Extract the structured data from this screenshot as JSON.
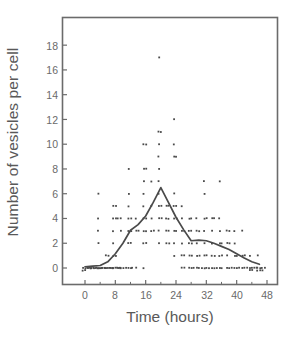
{
  "chart_data": {
    "type": "scatter",
    "title": "",
    "xlabel": "Time (hours)",
    "ylabel": "Number of vesicles per cell",
    "xlim": [
      -3,
      51
    ],
    "ylim": [
      -1.2,
      19.2
    ],
    "xticks": [
      0,
      8,
      16,
      24,
      32,
      40,
      48
    ],
    "yticks": [
      0,
      2,
      4,
      6,
      8,
      10,
      12,
      14,
      16,
      18
    ],
    "xtick_labels": [
      "0",
      "8",
      "16",
      "24",
      "32",
      "40",
      "48"
    ],
    "ytick_labels": [
      "0",
      "2",
      "4",
      "6",
      "8",
      "10",
      "12",
      "14",
      "16",
      "18"
    ],
    "grid": false,
    "legend": null,
    "frame": "full-box",
    "marker": "small-square-dot",
    "marker_color": "#4a4a4a",
    "line_color": "#4a4a4a",
    "axis_color": "#6b6b6b",
    "background": "#ffffff",
    "series": [
      {
        "name": "mean vesicles per cell",
        "type": "line",
        "x": [
          0,
          2,
          4,
          6,
          8,
          10,
          12,
          14,
          16,
          18,
          20,
          22,
          24,
          26,
          28,
          30,
          32,
          34,
          36,
          38,
          40,
          42,
          44,
          46
        ],
        "values": [
          0.1,
          0.15,
          0.2,
          0.5,
          1.15,
          2.0,
          3.05,
          3.5,
          4.2,
          5.3,
          6.5,
          5.3,
          4.1,
          3.1,
          2.2,
          2.25,
          2.2,
          2.0,
          1.75,
          1.5,
          1.15,
          0.8,
          0.5,
          0.3
        ]
      },
      {
        "name": "individual cell observations",
        "type": "scatter",
        "points": [
          [
            0,
            0
          ],
          [
            0,
            0
          ],
          [
            0,
            0
          ],
          [
            0,
            0
          ],
          [
            0,
            0
          ],
          [
            0,
            0
          ],
          [
            1,
            0
          ],
          [
            1,
            0
          ],
          [
            1,
            0
          ],
          [
            2,
            0
          ],
          [
            2,
            0
          ],
          [
            2,
            0
          ],
          [
            2,
            0
          ],
          [
            3,
            0
          ],
          [
            3,
            0
          ],
          [
            3,
            0
          ],
          [
            4,
            0
          ],
          [
            4,
            0
          ],
          [
            4,
            0
          ],
          [
            4,
            0
          ],
          [
            5,
            0
          ],
          [
            5,
            0
          ],
          [
            6,
            0
          ],
          [
            6,
            0
          ],
          [
            6,
            0
          ],
          [
            6,
            0
          ],
          [
            7,
            0
          ],
          [
            7,
            0
          ],
          [
            8,
            0
          ],
          [
            8,
            0
          ],
          [
            8,
            0
          ],
          [
            8,
            0
          ],
          [
            9,
            0
          ],
          [
            9,
            0
          ],
          [
            10,
            0
          ],
          [
            10,
            0
          ],
          [
            10,
            0
          ],
          [
            12,
            0
          ],
          [
            12,
            0
          ],
          [
            13,
            0
          ],
          [
            14,
            0
          ],
          [
            16,
            0
          ],
          [
            4,
            6
          ],
          [
            4,
            4
          ],
          [
            4,
            3
          ],
          [
            4,
            2
          ],
          [
            6,
            1
          ],
          [
            6,
            1
          ],
          [
            8,
            5
          ],
          [
            8,
            5
          ],
          [
            8,
            4
          ],
          [
            8,
            4
          ],
          [
            8,
            4
          ],
          [
            8,
            3
          ],
          [
            8,
            2
          ],
          [
            8,
            1
          ],
          [
            8,
            1
          ],
          [
            10,
            4
          ],
          [
            10,
            3
          ],
          [
            12,
            8
          ],
          [
            12,
            6
          ],
          [
            12,
            5
          ],
          [
            12,
            4
          ],
          [
            12,
            4
          ],
          [
            12,
            3
          ],
          [
            12,
            3
          ],
          [
            12,
            2
          ],
          [
            12,
            2
          ],
          [
            14,
            4
          ],
          [
            14,
            3
          ],
          [
            14,
            3
          ],
          [
            16,
            10
          ],
          [
            16,
            10
          ],
          [
            16,
            8
          ],
          [
            16,
            8
          ],
          [
            16,
            7
          ],
          [
            16,
            6
          ],
          [
            16,
            5
          ],
          [
            16,
            4
          ],
          [
            16,
            4
          ],
          [
            16,
            3
          ],
          [
            16,
            3
          ],
          [
            16,
            2
          ],
          [
            16,
            2
          ],
          [
            18,
            7
          ],
          [
            18,
            5
          ],
          [
            18,
            4
          ],
          [
            18,
            3
          ],
          [
            18,
            3
          ],
          [
            20,
            17
          ],
          [
            20,
            11
          ],
          [
            20,
            11
          ],
          [
            20,
            10
          ],
          [
            20,
            9
          ],
          [
            20,
            8
          ],
          [
            20,
            7
          ],
          [
            20,
            6
          ],
          [
            20,
            5
          ],
          [
            20,
            5
          ],
          [
            20,
            4
          ],
          [
            20,
            4
          ],
          [
            20,
            3
          ],
          [
            20,
            2
          ],
          [
            22,
            5
          ],
          [
            22,
            5
          ],
          [
            22,
            4
          ],
          [
            22,
            4
          ],
          [
            22,
            3
          ],
          [
            22,
            3
          ],
          [
            22,
            2
          ],
          [
            22,
            2
          ],
          [
            24,
            12
          ],
          [
            24,
            10
          ],
          [
            24,
            9
          ],
          [
            24,
            9
          ],
          [
            24,
            6
          ],
          [
            24,
            5
          ],
          [
            24,
            5
          ],
          [
            24,
            4
          ],
          [
            24,
            4
          ],
          [
            24,
            3
          ],
          [
            24,
            3
          ],
          [
            24,
            2
          ],
          [
            24,
            1
          ],
          [
            26,
            5
          ],
          [
            26,
            4
          ],
          [
            26,
            3
          ],
          [
            26,
            3
          ],
          [
            26,
            2
          ],
          [
            26,
            1
          ],
          [
            26,
            1
          ],
          [
            26,
            0
          ],
          [
            26,
            0
          ],
          [
            28,
            4
          ],
          [
            28,
            4
          ],
          [
            28,
            3
          ],
          [
            28,
            3
          ],
          [
            28,
            2
          ],
          [
            28,
            2
          ],
          [
            28,
            1
          ],
          [
            28,
            1
          ],
          [
            28,
            0
          ],
          [
            28,
            0
          ],
          [
            28,
            0
          ],
          [
            30,
            4
          ],
          [
            30,
            3
          ],
          [
            30,
            3
          ],
          [
            30,
            2
          ],
          [
            30,
            1
          ],
          [
            30,
            1
          ],
          [
            30,
            0
          ],
          [
            30,
            0
          ],
          [
            30,
            0
          ],
          [
            32,
            7
          ],
          [
            32,
            6
          ],
          [
            32,
            4
          ],
          [
            32,
            4
          ],
          [
            32,
            3
          ],
          [
            32,
            2
          ],
          [
            32,
            1
          ],
          [
            32,
            1
          ],
          [
            32,
            0
          ],
          [
            32,
            0
          ],
          [
            32,
            0
          ],
          [
            34,
            4
          ],
          [
            34,
            4
          ],
          [
            34,
            3
          ],
          [
            34,
            2
          ],
          [
            34,
            1
          ],
          [
            34,
            1
          ],
          [
            34,
            0
          ],
          [
            34,
            0
          ],
          [
            34,
            0
          ],
          [
            36,
            7
          ],
          [
            36,
            4
          ],
          [
            36,
            3
          ],
          [
            36,
            2
          ],
          [
            36,
            2
          ],
          [
            36,
            1
          ],
          [
            36,
            1
          ],
          [
            36,
            0
          ],
          [
            36,
            0
          ],
          [
            38,
            3
          ],
          [
            38,
            3
          ],
          [
            38,
            2
          ],
          [
            38,
            2
          ],
          [
            38,
            1
          ],
          [
            38,
            0
          ],
          [
            38,
            0
          ],
          [
            38,
            0
          ],
          [
            40,
            3
          ],
          [
            40,
            2
          ],
          [
            40,
            1
          ],
          [
            40,
            1
          ],
          [
            40,
            0
          ],
          [
            40,
            0
          ],
          [
            40,
            0
          ],
          [
            42,
            3
          ],
          [
            42,
            1
          ],
          [
            42,
            1
          ],
          [
            42,
            0
          ],
          [
            42,
            0
          ],
          [
            42,
            0
          ],
          [
            44,
            1
          ],
          [
            44,
            0
          ],
          [
            44,
            0
          ],
          [
            44,
            0
          ],
          [
            44,
            0
          ],
          [
            44,
            0
          ],
          [
            44,
            0
          ],
          [
            46,
            1
          ],
          [
            46,
            0
          ],
          [
            46,
            0
          ],
          [
            46,
            0
          ],
          [
            46,
            0
          ],
          [
            46,
            0
          ],
          [
            46,
            0
          ],
          [
            46,
            0
          ]
        ]
      }
    ]
  }
}
